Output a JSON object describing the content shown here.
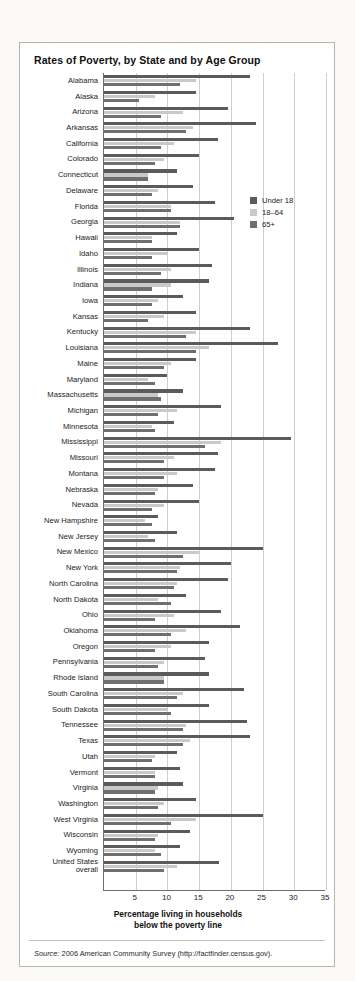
{
  "figure": {
    "title": "Rates of Poverty, by State and by Age Group",
    "source_prefix": "Source:",
    "source_text": "2006 American Community Survey (http://factfinder.census.gov)."
  },
  "legend": {
    "position": "inside-top-right",
    "items": [
      {
        "label": "Under 18",
        "color": "#5b5b5b"
      },
      {
        "label": "18–64",
        "color": "#c9c9c9"
      },
      {
        "label": "65+",
        "color": "#6f6f6f"
      }
    ]
  },
  "chart_data": {
    "type": "bar",
    "orientation": "horizontal",
    "title": "Rates of Poverty, by State and by Age Group",
    "xlabel": "Percentage living in households\nbelow the poverty line",
    "xlabel_line1": "Percentage living in households",
    "xlabel_line2": "below the poverty line",
    "ylabel": "",
    "xlim": [
      0,
      35
    ],
    "xticks": [
      5,
      10,
      15,
      20,
      25,
      30,
      35
    ],
    "grid": "vertical",
    "legend_position": "inside-top-right",
    "categories": [
      "Alabama",
      "Alaska",
      "Arizona",
      "Arkansas",
      "California",
      "Colorado",
      "Connecticut",
      "Delaware",
      "Florida",
      "Georgia",
      "Hawaii",
      "Idaho",
      "Illinois",
      "Indiana",
      "Iowa",
      "Kansas",
      "Kentucky",
      "Louisiana",
      "Maine",
      "Maryland",
      "Massachusetts",
      "Michigan",
      "Minnesota",
      "Mississippi",
      "Missouri",
      "Montana",
      "Nebraska",
      "Nevada",
      "New Hampshire",
      "New Jersey",
      "New Mexico",
      "New York",
      "North Carolina",
      "North Dakota",
      "Ohio",
      "Oklahoma",
      "Oregon",
      "Pennsylvania",
      "Rhode Island",
      "South Carolina",
      "South Dakota",
      "Tennessee",
      "Texas",
      "Utah",
      "Vermont",
      "Virginia",
      "Washington",
      "West Virginia",
      "Wisconsin",
      "Wyoming",
      "United States\noverall"
    ],
    "series": [
      {
        "name": "Under 18",
        "color": "#5b5b5b",
        "values": [
          23.0,
          14.5,
          19.5,
          24.0,
          18.0,
          15.0,
          11.5,
          14.0,
          17.5,
          20.5,
          11.5,
          15.0,
          17.0,
          16.5,
          12.5,
          14.5,
          23.0,
          27.5,
          14.5,
          10.0,
          12.5,
          18.5,
          11.0,
          29.5,
          18.0,
          17.5,
          14.0,
          15.0,
          8.5,
          11.5,
          25.0,
          20.0,
          19.5,
          13.0,
          18.5,
          21.5,
          16.5,
          16.0,
          16.5,
          22.0,
          16.5,
          22.5,
          23.0,
          11.5,
          12.0,
          12.5,
          14.5,
          25.0,
          13.5,
          12.0,
          18.2
        ]
      },
      {
        "name": "18–64",
        "color": "#c9c9c9",
        "values": [
          14.5,
          8.0,
          12.5,
          14.0,
          11.0,
          9.5,
          7.0,
          8.5,
          10.5,
          12.0,
          7.5,
          10.0,
          10.5,
          10.5,
          8.5,
          9.5,
          14.5,
          16.5,
          10.5,
          7.0,
          8.5,
          11.5,
          7.5,
          18.5,
          11.0,
          11.5,
          8.5,
          9.5,
          6.5,
          7.0,
          15.0,
          12.0,
          11.5,
          8.5,
          11.0,
          13.0,
          10.5,
          9.5,
          9.5,
          12.5,
          10.0,
          13.0,
          13.5,
          8.0,
          8.0,
          8.5,
          9.5,
          14.5,
          8.5,
          8.0,
          11.5
        ]
      },
      {
        "name": "65+",
        "color": "#6f6f6f",
        "values": [
          12.0,
          5.5,
          9.0,
          13.0,
          9.0,
          8.0,
          7.0,
          7.5,
          10.5,
          12.0,
          7.5,
          7.5,
          9.0,
          7.5,
          7.5,
          7.0,
          13.0,
          14.5,
          9.5,
          8.0,
          9.0,
          8.5,
          8.0,
          16.0,
          9.5,
          9.5,
          8.0,
          7.5,
          7.5,
          8.0,
          12.5,
          11.5,
          11.0,
          10.5,
          8.0,
          10.5,
          8.0,
          8.5,
          9.5,
          11.5,
          10.5,
          12.5,
          12.5,
          7.5,
          8.0,
          8.0,
          8.5,
          10.5,
          8.0,
          9.0,
          9.5
        ]
      }
    ]
  }
}
